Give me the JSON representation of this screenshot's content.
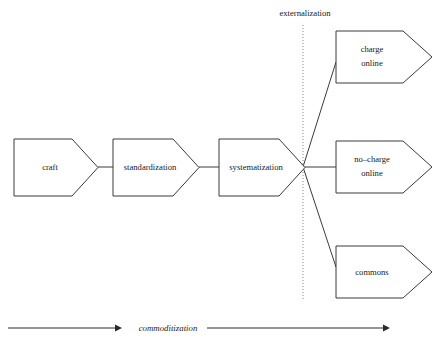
{
  "diagram": {
    "background_color": "#ffffff",
    "stroke_color": "#3a3a3a",
    "divider": {
      "label": "externalization",
      "label_x": 305,
      "label_y": 16,
      "line_x": 303,
      "line_top": 25,
      "line_bottom": 301,
      "style": "dotted",
      "color": "#8a8a8a"
    },
    "branch_point": {
      "x": 303,
      "y": 167
    },
    "stages": [
      {
        "id": "craft",
        "label": "craft",
        "label_lines": [
          "craft"
        ],
        "x": 14,
        "y": 139,
        "width": 84,
        "height": 57,
        "notch": 26,
        "text_x": 50,
        "text_y": 167
      },
      {
        "id": "standardization",
        "label": "standardization",
        "label_lines": [
          "standardization"
        ],
        "x": 113,
        "y": 139,
        "width": 86,
        "height": 57,
        "notch": 26,
        "text_x": 150,
        "text_y": 167
      },
      {
        "id": "systematization",
        "label": "systematization",
        "label_lines": [
          "systematization"
        ],
        "x": 219,
        "y": 139,
        "width": 86,
        "height": 57,
        "notch": 26,
        "text_x": 256,
        "text_y": 167
      }
    ],
    "outcomes": [
      {
        "id": "charge-online",
        "label": "charge online",
        "label_lines": [
          "charge",
          "online"
        ],
        "x": 336,
        "y": 31,
        "width": 96,
        "height": 52,
        "notch": 29,
        "text_x": 372,
        "text_y": 57,
        "connector_to": {
          "x": 336,
          "y": 62
        }
      },
      {
        "id": "no-charge-online",
        "label": "no-charge online",
        "label_lines": [
          "no–charge",
          "online"
        ],
        "x": 336,
        "y": 141,
        "width": 96,
        "height": 52,
        "notch": 29,
        "text_x": 372,
        "text_y": 167,
        "connector_to": {
          "x": 336,
          "y": 167
        }
      },
      {
        "id": "commons",
        "label": "commons",
        "label_lines": [
          "commons"
        ],
        "x": 336,
        "y": 246,
        "width": 96,
        "height": 52,
        "notch": 29,
        "text_x": 372,
        "text_y": 272,
        "connector_to": {
          "x": 336,
          "y": 267
        }
      }
    ],
    "axis": {
      "label": "commoditization",
      "label_x": 168,
      "label_y": 331,
      "y": 328,
      "left_arrow": {
        "x1": 8,
        "x2": 120
      },
      "right_arrow": {
        "x1": 207,
        "x2": 388
      }
    }
  }
}
